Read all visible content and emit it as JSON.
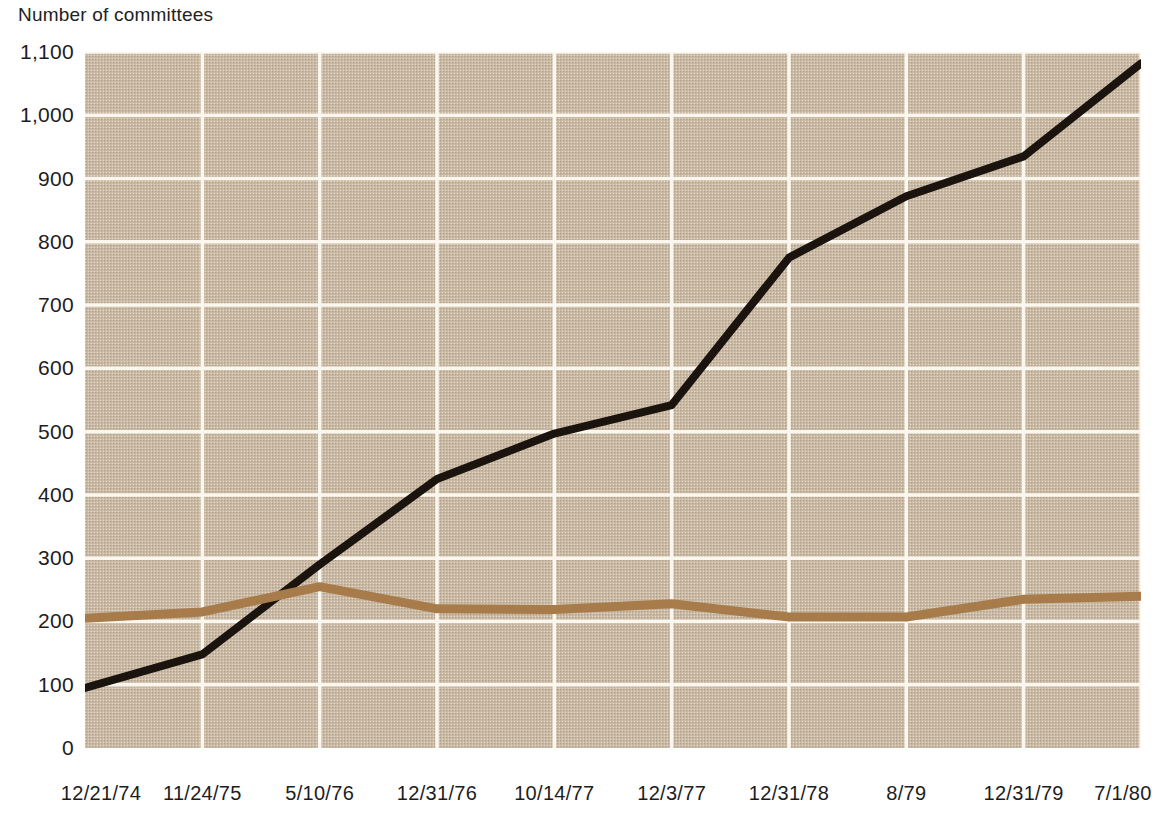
{
  "chart_data": {
    "type": "line",
    "title": "Number of committees",
    "xlabel": "",
    "ylabel": "Number of committees",
    "grid": true,
    "legend": "none",
    "ylim": [
      0,
      1100
    ],
    "yticks": [
      "0",
      "100",
      "200",
      "300",
      "400",
      "500",
      "600",
      "700",
      "800",
      "900",
      "1,000",
      "1,100"
    ],
    "ytick_values": [
      0,
      100,
      200,
      300,
      400,
      500,
      600,
      700,
      800,
      900,
      1000,
      1100
    ],
    "categories": [
      "12/21/74",
      "11/24/75",
      "5/10/76",
      "12/31/76",
      "10/14/77",
      "12/3/77",
      "12/31/78",
      "8/79",
      "12/31/79",
      "7/1/80"
    ],
    "series": [
      {
        "name": "black-series",
        "color": "#1b140e",
        "values": [
          95,
          148,
          290,
          425,
          497,
          542,
          775,
          872,
          935,
          1082
        ]
      },
      {
        "name": "brown-series",
        "color": "#a87b4a",
        "values": [
          205,
          215,
          255,
          220,
          219,
          228,
          207,
          207,
          235,
          240
        ]
      }
    ]
  },
  "style": {
    "plot_background": "#cbbba5",
    "grid_color": "#fbf7ef",
    "page_background": "#ffffff",
    "text_color": "#1d1d1d"
  }
}
